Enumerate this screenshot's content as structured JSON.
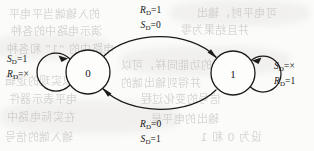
{
  "figure": {
    "type": "state-transition-diagram",
    "caption": "",
    "states": [
      {
        "id": "s0",
        "label": "0",
        "cx": 88,
        "cy": 72,
        "r": 22
      },
      {
        "id": "s1",
        "label": "1",
        "cx": 233,
        "cy": 73,
        "r": 22
      }
    ],
    "transitions": [
      {
        "id": "t-0-to-1",
        "from": "0",
        "to": "1",
        "position": "top",
        "conditions": [
          {
            "var": "R",
            "sub": "D",
            "op": "=",
            "value": "1"
          },
          {
            "var": "S",
            "sub": "D",
            "op": "=",
            "value": "0"
          }
        ]
      },
      {
        "id": "t-1-to-0",
        "from": "1",
        "to": "0",
        "position": "bottom",
        "conditions": [
          {
            "var": "R",
            "sub": "D",
            "op": "=",
            "value": "0"
          },
          {
            "var": "S",
            "sub": "D",
            "op": "=",
            "value": "1"
          }
        ]
      },
      {
        "id": "t-0-self",
        "from": "0",
        "to": "0",
        "position": "left",
        "conditions": [
          {
            "var": "S",
            "sub": "D",
            "op": "=",
            "value": "1"
          },
          {
            "var": "R",
            "sub": "D",
            "op": "=",
            "value": "×"
          }
        ]
      },
      {
        "id": "t-1-self",
        "from": "1",
        "to": "1",
        "position": "right",
        "conditions": [
          {
            "var": "S",
            "sub": "D",
            "op": "=",
            "value": "×"
          },
          {
            "var": "R",
            "sub": "D",
            "op": "=",
            "value": "1"
          }
        ]
      }
    ],
    "colors": {
      "ink": "#1c1b1a",
      "paper": "#fbfbfa",
      "ghost": "#b9b7b4"
    }
  },
  "ghost_text": {
    "note": "faint show-through from the reverse side of the scanned page",
    "lines": [
      {
        "text": "的入输端当平电平",
        "x": 8,
        "y": 5,
        "size": 11
      },
      {
        "text": "可电平时，输出",
        "x": 196,
        "y": 4,
        "size": 11
      },
      {
        "text": "演示电路中的各种",
        "x": 10,
        "y": 22,
        "size": 11
      },
      {
        "text": "并且结果为零",
        "x": 180,
        "y": 21,
        "size": 11
      },
      {
        "text": "电路中的 “1” 和各种",
        "x": 6,
        "y": 40,
        "size": 11
      },
      {
        "text": "的功能同样，可以",
        "x": 120,
        "y": 56,
        "size": 11
      },
      {
        "text": "可以实现的逻辑",
        "x": 4,
        "y": 72,
        "size": 11
      },
      {
        "text": "并得到输出端的",
        "x": 120,
        "y": 74,
        "size": 11
      },
      {
        "text": "电平表示器件",
        "x": 8,
        "y": 90,
        "size": 11
      },
      {
        "text": "信号的变化过程",
        "x": 140,
        "y": 90,
        "size": 11
      },
      {
        "text": "在实际电路中",
        "x": 6,
        "y": 108,
        "size": 11
      },
      {
        "text": "输出的电平是",
        "x": 150,
        "y": 110,
        "size": 11
      },
      {
        "text": "输入端的信号",
        "x": 4,
        "y": 128,
        "size": 11
      },
      {
        "text": "设为 0 和 1",
        "x": 200,
        "y": 128,
        "size": 11
      }
    ]
  }
}
